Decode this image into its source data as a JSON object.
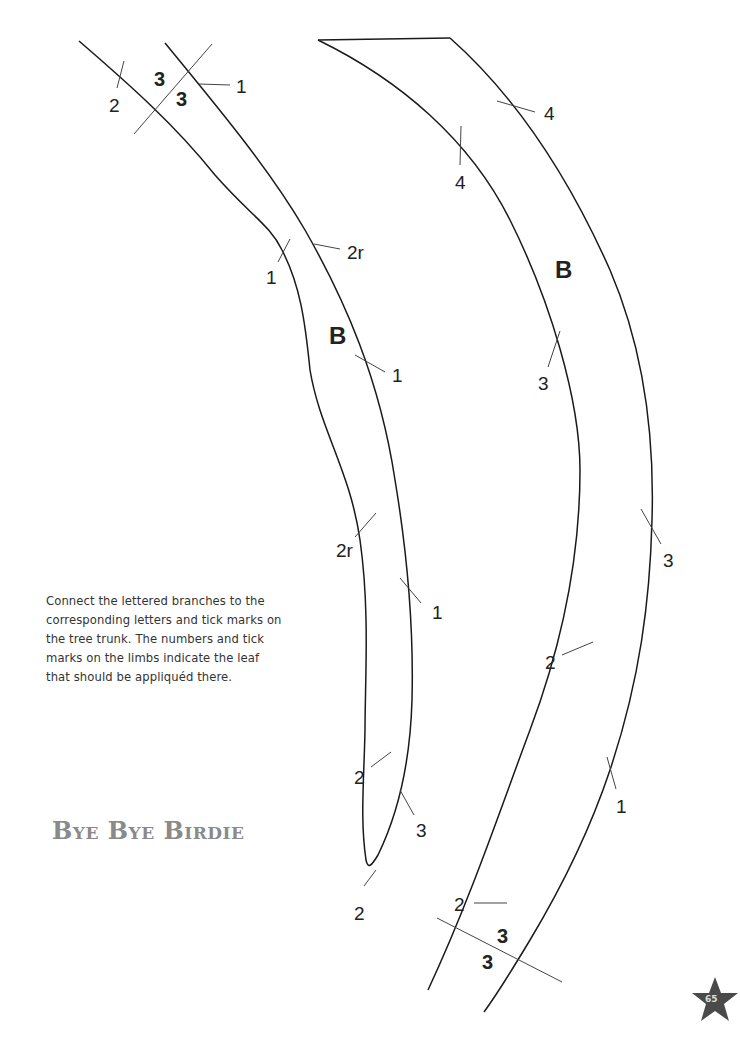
{
  "page": {
    "number": "65",
    "title": "Bye Bye Birdie",
    "instructions": "Connect the lettered branches to the corresponding letters and tick marks on the tree trunk. The numbers and tick marks on the limbs indicate the leaf that should be appliquéd there."
  },
  "left_branch": {
    "letter": "B",
    "labels": [
      "3",
      "3",
      "1",
      "2",
      "2r",
      "1",
      "1",
      "2r",
      "1",
      "2",
      "3",
      "2"
    ]
  },
  "right_branch": {
    "letter": "B",
    "labels": [
      "4",
      "4",
      "3",
      "3",
      "2",
      "1",
      "2",
      "3",
      "3"
    ]
  }
}
